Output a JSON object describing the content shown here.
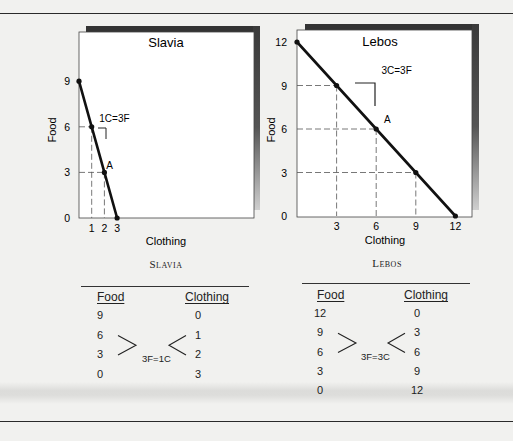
{
  "chart_data": [
    {
      "type": "line",
      "title": "Slavia",
      "xlabel": "Clothing",
      "ylabel": "Food",
      "xlim": [
        0,
        3
      ],
      "ylim": [
        0,
        9
      ],
      "x_ticks": [
        "1",
        "2",
        "3"
      ],
      "y_ticks": [
        "0",
        "3",
        "6",
        "9"
      ],
      "origin_label": "0",
      "series": [
        {
          "name": "Production possibilities",
          "x": [
            0,
            1,
            2,
            3
          ],
          "y": [
            9,
            6,
            3,
            0
          ]
        }
      ],
      "guides": [
        {
          "x": 1,
          "y": 6
        },
        {
          "x": 2,
          "y": 3
        }
      ],
      "annotations": [
        {
          "text": "1C=3F",
          "x": 1.6,
          "y": 6.3
        },
        {
          "text": "A",
          "x": 2.15,
          "y": 3.2
        }
      ]
    },
    {
      "type": "line",
      "title": "Lebos",
      "xlabel": "Clothing",
      "ylabel": "Food",
      "xlim": [
        0,
        12
      ],
      "ylim": [
        0,
        12
      ],
      "x_ticks": [
        "3",
        "6",
        "9",
        "12"
      ],
      "y_ticks": [
        "0",
        "3",
        "6",
        "9",
        "12"
      ],
      "series": [
        {
          "name": "Production possibilities",
          "x": [
            0,
            3,
            6,
            9,
            12
          ],
          "y": [
            12,
            9,
            6,
            3,
            0
          ]
        }
      ],
      "guides": [
        {
          "x": 3,
          "y": 9
        },
        {
          "x": 6,
          "y": 6
        },
        {
          "x": 9,
          "y": 3
        }
      ],
      "annotations": [
        {
          "text": "3C=3F",
          "x": 6.4,
          "y": 9.8
        },
        {
          "text": "A",
          "x": 6.6,
          "y": 6.4
        }
      ]
    }
  ],
  "tables": [
    {
      "title": "Slavia",
      "headers": [
        "Food",
        "Clothing"
      ],
      "food": [
        "9",
        "6",
        "3",
        "0"
      ],
      "clothing": [
        "0",
        "1",
        "2",
        "3"
      ],
      "tradeoff": "3F=1C"
    },
    {
      "title": "Lebos",
      "headers": [
        "Food",
        "Clothing"
      ],
      "food": [
        "12",
        "9",
        "6",
        "3",
        "0"
      ],
      "clothing": [
        "0",
        "3",
        "6",
        "9",
        "12"
      ],
      "tradeoff": "3F=3C"
    }
  ]
}
